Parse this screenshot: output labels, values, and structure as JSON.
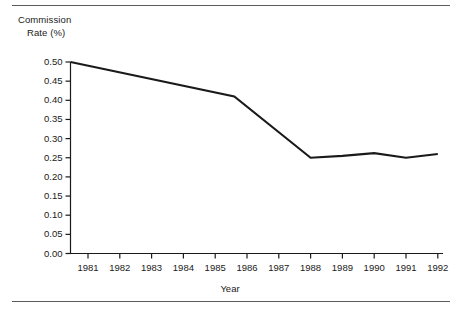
{
  "figure": {
    "y_axis_title_line1": "Commission",
    "y_axis_title_line2": "Rate (%)",
    "x_axis_title": "Year"
  },
  "chart_data": {
    "type": "line",
    "title": "",
    "xlabel": "Year",
    "ylabel": "Commission Rate (%)",
    "xlim": [
      1980.45,
      1992.3
    ],
    "ylim": [
      0.0,
      0.5
    ],
    "grid": false,
    "legend": null,
    "line_color": "#1a1a1a",
    "x": [
      1980.45,
      1985.6,
      1988,
      1989,
      1990,
      1991,
      1992
    ],
    "y": [
      0.5,
      0.41,
      0.25,
      0.255,
      0.262,
      0.25,
      0.26
    ],
    "series": [
      {
        "name": "Commission Rate (%)",
        "points": [
          {
            "x": 1980.45,
            "y": 0.5
          },
          {
            "x": 1985.6,
            "y": 0.41
          },
          {
            "x": 1988.0,
            "y": 0.25
          },
          {
            "x": 1989.0,
            "y": 0.255
          },
          {
            "x": 1990.0,
            "y": 0.262
          },
          {
            "x": 1991.0,
            "y": 0.25
          },
          {
            "x": 1992.0,
            "y": 0.26
          }
        ]
      }
    ],
    "ytick_labels": [
      "0.00",
      "0.05",
      "0.10",
      "0.15",
      "0.20",
      "0.25",
      "0.30",
      "0.35",
      "0.40",
      "0.45",
      "0.50"
    ],
    "ytick_values": [
      0.0,
      0.05,
      0.1,
      0.15,
      0.2,
      0.25,
      0.3,
      0.35,
      0.4,
      0.45,
      0.5
    ],
    "xtick_labels": [
      "1981",
      "1982",
      "1983",
      "1984",
      "1985",
      "1986",
      "1987",
      "1988",
      "1989",
      "1990",
      "1991",
      "1992"
    ],
    "xtick_values": [
      1981,
      1982,
      1983,
      1984,
      1985,
      1986,
      1987,
      1988,
      1989,
      1990,
      1991,
      1992
    ]
  }
}
